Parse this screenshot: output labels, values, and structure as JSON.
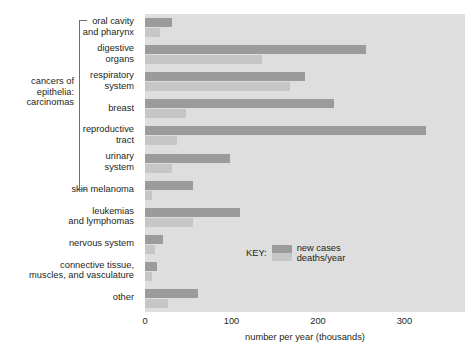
{
  "chart_data": {
    "type": "bar",
    "orientation": "horizontal",
    "title": "",
    "xlabel": "number per year (thousands)",
    "ylabel": "",
    "xlim": [
      0,
      370
    ],
    "xticks": [
      0,
      100,
      200,
      300
    ],
    "xtick_labels": [
      "0",
      "100",
      "200",
      "300"
    ],
    "grid": false,
    "legend": {
      "title": "KEY:",
      "position": "inside-right",
      "entries": [
        "new cases",
        "deaths/year"
      ]
    },
    "colors": {
      "new_cases": "#9b9b9b",
      "deaths_per_year": "#c6c6c6",
      "plot_background": "#dedede",
      "text": "#231f20",
      "bracket": "#6d6e71"
    },
    "group_bracket": {
      "label": "cancers of\nepithelia:\ncarcinomas",
      "covers": [
        "oral cavity\nand pharynx",
        "digestive\norgans",
        "respiratory\nsystem",
        "breast",
        "reproductive\ntract",
        "urinary\nsystem"
      ]
    },
    "categories": [
      "oral cavity\nand pharynx",
      "digestive\norgans",
      "respiratory\nsystem",
      "breast",
      "reproductive\ntract",
      "urinary\nsystem",
      "skin melanoma",
      "leukemias\nand lymphomas",
      "nervous system",
      "connective tissue,\nmuscles, and vasculature",
      "other"
    ],
    "series": [
      {
        "name": "new cases",
        "color": "#9b9b9b",
        "values": [
          31,
          255,
          185,
          218,
          325,
          98,
          55,
          110,
          21,
          14,
          61
        ]
      },
      {
        "name": "deaths/year",
        "color": "#c6c6c6",
        "values": [
          17,
          135,
          168,
          47,
          37,
          31,
          8,
          55,
          12,
          8,
          27
        ]
      }
    ]
  }
}
